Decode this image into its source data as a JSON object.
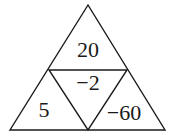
{
  "diagram": {
    "type": "triangle-number-puzzle",
    "stroke_color": "#1a1a1a",
    "background_color": "#ffffff",
    "vertices": {
      "apex": [
        88,
        5
      ],
      "bottom_left": [
        10,
        130
      ],
      "bottom_right": [
        165,
        130
      ],
      "mid_left": [
        49,
        70
      ],
      "mid_right": [
        127,
        70
      ],
      "mid_bottom": [
        88,
        130
      ]
    },
    "cells": {
      "top": {
        "value": "20",
        "x": 88,
        "y": 52
      },
      "center": {
        "value": "−2",
        "x": 88,
        "y": 85
      },
      "bottom_left": {
        "value": "5",
        "x": 44,
        "y": 112
      },
      "bottom_right": {
        "value": "−60",
        "x": 124,
        "y": 115
      }
    }
  }
}
